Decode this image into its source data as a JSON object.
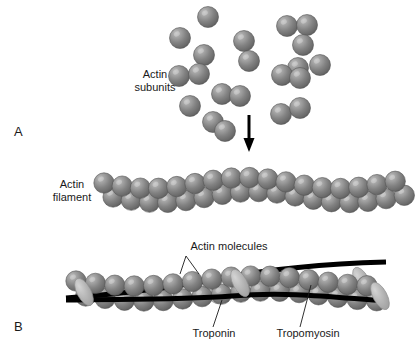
{
  "figure": {
    "background_color": "#ffffff",
    "width": 417,
    "height": 347
  },
  "palette": {
    "sphere_light": "#b9b9b9",
    "sphere_mid": "#8a8a8a",
    "sphere_dark": "#5e5e5e",
    "sphere_edge": "#4a4a4a",
    "troponin_light": "#c6c6c6",
    "troponin_dark": "#9a9a9a",
    "tropomyosin": "#000000",
    "arrow": "#000000",
    "text": "#1a1a1a"
  },
  "panel_a": {
    "letter": "A",
    "letter_x": 14,
    "letter_y": 136,
    "labels": [
      {
        "name": "actin-subunits-label",
        "line1": "Actin",
        "line2": "subunits",
        "x": 155,
        "y": 78
      },
      {
        "name": "actin-filament-label",
        "line1": "Actin",
        "line2": "filament",
        "x": 72,
        "y": 188
      }
    ],
    "arrow": {
      "name": "polymerization-arrow",
      "x": 249,
      "y_top": 115,
      "y_bottom": 152,
      "shaft_width": 3,
      "head_width": 11,
      "head_height": 13
    },
    "subunits": [
      {
        "cx": 208,
        "cy": 17,
        "r": 10.5
      },
      {
        "cx": 287,
        "cy": 26,
        "r": 10.5
      },
      {
        "cx": 307,
        "cy": 25,
        "r": 10.5
      },
      {
        "cx": 180,
        "cy": 38,
        "r": 10.5
      },
      {
        "cx": 244,
        "cy": 41,
        "r": 10.5
      },
      {
        "cx": 303,
        "cy": 45,
        "r": 10.5
      },
      {
        "cx": 204,
        "cy": 55,
        "r": 10.5
      },
      {
        "cx": 249,
        "cy": 61,
        "r": 10.5
      },
      {
        "cx": 298,
        "cy": 68,
        "r": 10.5
      },
      {
        "cx": 179,
        "cy": 76,
        "r": 10.5
      },
      {
        "cx": 199,
        "cy": 74,
        "r": 10.5
      },
      {
        "cx": 320,
        "cy": 65,
        "r": 10.5
      },
      {
        "cx": 282,
        "cy": 75,
        "r": 10.5
      },
      {
        "cx": 300,
        "cy": 78,
        "r": 10.5
      },
      {
        "cx": 222,
        "cy": 94,
        "r": 10.5
      },
      {
        "cx": 240,
        "cy": 96,
        "r": 10.5
      },
      {
        "cx": 190,
        "cy": 106,
        "r": 10.5
      },
      {
        "cx": 281,
        "cy": 114,
        "r": 10.5
      },
      {
        "cx": 300,
        "cy": 108,
        "r": 10.5
      },
      {
        "cx": 213,
        "cy": 122,
        "r": 10.5
      },
      {
        "cx": 225,
        "cy": 131,
        "r": 10.5
      }
    ],
    "filament": {
      "name": "actin-filament",
      "bead_count": 17,
      "bead_radius": 10.2,
      "start_x": 104,
      "spacing": 18.2,
      "top_row_y": 183,
      "bottom_row_y": 197,
      "wave_amplitude": 5.5,
      "wave_cycles": 1.55
    }
  },
  "panel_b": {
    "letter": "B",
    "letter_x": 14,
    "letter_y": 331,
    "labels": [
      {
        "name": "actin-molecules-label",
        "text": "Actin molecules",
        "x": 159,
        "y": 252
      },
      {
        "name": "troponin-label",
        "text": "Troponin",
        "x": 190,
        "y": 334
      },
      {
        "name": "tropomyosin-label",
        "text": "Tropomyosin",
        "x": 275,
        "y": 334
      }
    ],
    "filament": {
      "name": "actin-filament-regulated",
      "bead_count": 16,
      "bead_radius": 10.2,
      "start_x": 76,
      "spacing": 19.4,
      "top_row_y": 281,
      "bottom_row_y": 296,
      "wave_amplitude": 5.0,
      "wave_cycles": 1.2
    },
    "troponin": {
      "name": "troponin-complexes",
      "positions": [
        {
          "cx": 84,
          "cy": 292,
          "angle": -28
        },
        {
          "cx": 212,
          "cy": 290,
          "angle": -28
        },
        {
          "cx": 240,
          "cy": 283,
          "angle": -28
        },
        {
          "cx": 362,
          "cy": 281,
          "angle": -28
        },
        {
          "cx": 380,
          "cy": 296,
          "angle": -28
        }
      ],
      "rx": 7,
      "ry": 15
    },
    "tropomyosin": {
      "name": "tropomyosin-strands",
      "stroke_width": 5,
      "strand_upper": "M 66,298 C 120,294 170,288 222,278 C 270,269 320,264 386,262",
      "strand_lower": "M 66,300 C 130,299 180,300 232,296 C 290,291 340,298 386,301"
    }
  }
}
